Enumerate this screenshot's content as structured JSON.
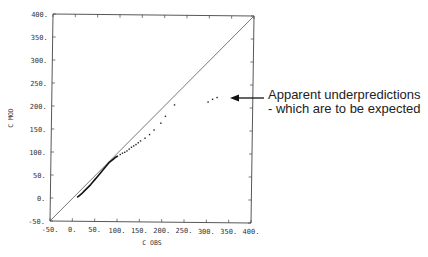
{
  "chart_data": {
    "type": "scatter",
    "title": "",
    "xlabel": "C OBS",
    "ylabel": "C MOD",
    "xlim": [
      -50,
      400
    ],
    "ylim": [
      -50,
      400
    ],
    "grid": false,
    "x_ticks": [
      "-50.",
      "0.",
      "50.",
      "100.",
      "150.",
      "200.",
      "250.",
      "300.",
      "350.",
      "400."
    ],
    "y_ticks": [
      "-50.",
      "0.",
      "50.",
      "100.",
      "150.",
      "200.",
      "250.",
      "300.",
      "350.",
      "400."
    ],
    "reference_line": {
      "name": "1:1 line",
      "from": [
        -50,
        -50
      ],
      "to": [
        400,
        400
      ]
    },
    "series": [
      {
        "name": "C MOD vs C OBS",
        "points": [
          [
            10,
            2
          ],
          [
            15,
            6
          ],
          [
            20,
            10
          ],
          [
            25,
            15
          ],
          [
            30,
            20
          ],
          [
            35,
            25
          ],
          [
            40,
            30
          ],
          [
            45,
            36
          ],
          [
            50,
            42
          ],
          [
            55,
            48
          ],
          [
            60,
            54
          ],
          [
            65,
            60
          ],
          [
            70,
            66
          ],
          [
            75,
            72
          ],
          [
            80,
            78
          ],
          [
            85,
            82
          ],
          [
            90,
            86
          ],
          [
            95,
            90
          ],
          [
            100,
            93
          ],
          [
            105,
            96
          ],
          [
            110,
            99
          ],
          [
            115,
            101
          ],
          [
            120,
            104
          ],
          [
            125,
            108
          ],
          [
            130,
            112
          ],
          [
            135,
            115
          ],
          [
            140,
            118
          ],
          [
            145,
            122
          ],
          [
            150,
            126
          ],
          [
            160,
            132
          ],
          [
            170,
            140
          ],
          [
            180,
            150
          ],
          [
            195,
            165
          ],
          [
            205,
            180
          ],
          [
            225,
            205
          ],
          [
            300,
            212
          ],
          [
            310,
            218
          ],
          [
            320,
            222
          ]
        ]
      }
    ],
    "annotations": [
      {
        "text": "Apparent underpredictions",
        "line2": "-  which are to be expected",
        "arrow_to": [
          330,
          220
        ]
      }
    ]
  },
  "annotation": {
    "line1": "Apparent underpredictions",
    "line2": "-  which are to be expected"
  }
}
